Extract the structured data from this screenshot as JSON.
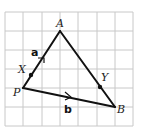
{
  "diagram": {
    "type": "triangle-on-grid",
    "grid": {
      "columns": 7,
      "rows": 6,
      "color": "#c8c8c8"
    },
    "points": {
      "A": {
        "label": "A",
        "grid": [
          3,
          1
        ]
      },
      "P": {
        "label": "P",
        "grid": [
          1,
          4
        ]
      },
      "B": {
        "label": "B",
        "grid": [
          6,
          5
        ]
      },
      "X": {
        "label": "X",
        "on": "PA"
      },
      "Y": {
        "label": "Y",
        "on": "AB"
      }
    },
    "vectors": {
      "a": {
        "label": "a",
        "from": "P",
        "to": "A"
      },
      "b": {
        "label": "b",
        "from": "P",
        "to": "B"
      }
    },
    "line_color": "#111111"
  }
}
